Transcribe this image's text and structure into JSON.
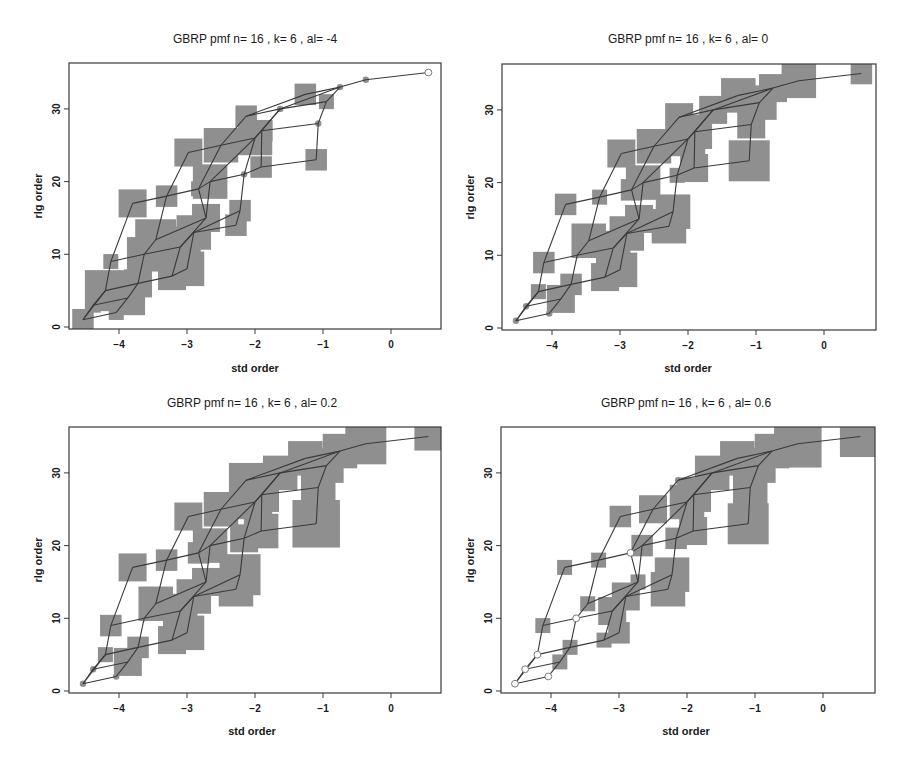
{
  "chart_data": [
    {
      "type": "scatter",
      "title": "GBRP pmf  n= 16 , k= 6 , al= -4",
      "xlabel": "std order",
      "ylabel": "rlg order",
      "xticks": [
        -4,
        -3,
        -2,
        -1,
        0
      ],
      "yticks": [
        0,
        10,
        20,
        30
      ],
      "xlim": [
        -4.75,
        0.73
      ],
      "ylim": [
        -0.3,
        35.7
      ],
      "sizes": [
        2,
        1,
        1,
        4,
        5,
        3,
        3,
        4,
        1,
        4,
        5,
        5,
        4,
        2,
        3,
        2,
        3,
        2,
        1,
        4,
        0,
        2,
        2,
        3,
        4,
        4,
        2,
        0,
        2,
        0,
        1,
        2,
        0,
        0,
        0
      ],
      "open": [
        35
      ]
    },
    {
      "type": "scatter",
      "title": "GBRP pmf  n= 16 , k= 6 , al= 0",
      "xlabel": "std order",
      "ylabel": "rlg order",
      "xticks": [
        -4,
        -3,
        -2,
        -1,
        0
      ],
      "yticks": [
        0,
        10,
        20,
        30
      ],
      "xlim": [
        -4.75,
        0.73
      ],
      "ylim": [
        -0.3,
        35.7
      ],
      "sizes": [
        0,
        0,
        0,
        3,
        1,
        2,
        3,
        4,
        2,
        0,
        4,
        4,
        4,
        4,
        3,
        4,
        2,
        1,
        2,
        4,
        1,
        3,
        5,
        3,
        4,
        4,
        4,
        3,
        3,
        3,
        4,
        4,
        3,
        4,
        2
      ],
      "open": []
    },
    {
      "type": "scatter",
      "title": "GBRP pmf  n= 16 , k= 6 , al= 0.2",
      "xlabel": "std order",
      "ylabel": "rlg order",
      "xticks": [
        -4,
        -3,
        -2,
        -1,
        0
      ],
      "yticks": [
        0,
        10,
        20,
        30
      ],
      "xlim": [
        -4.75,
        0.73
      ],
      "ylim": [
        -0.3,
        35.7
      ],
      "sizes": [
        0,
        0,
        0,
        3,
        1,
        2,
        3,
        4,
        2,
        0,
        4,
        4,
        4,
        4,
        3,
        5,
        3,
        2,
        2,
        4,
        3,
        4,
        6,
        3,
        4,
        4,
        4,
        4,
        4,
        4,
        4,
        4,
        4,
        5,
        3
      ],
      "open": []
    },
    {
      "type": "scatter",
      "title": "GBRP pmf  n= 16 , k= 6 , al= 0.6",
      "xlabel": "std order",
      "ylabel": "rlg order",
      "xticks": [
        -4,
        -3,
        -2,
        -1,
        0
      ],
      "yticks": [
        0,
        10,
        20,
        30
      ],
      "xlim": [
        -4.75,
        0.73
      ],
      "ylim": [
        -0.3,
        35.7
      ],
      "sizes": [
        0,
        0,
        0,
        1,
        0,
        1,
        1,
        2,
        1,
        0,
        3,
        1,
        3,
        4,
        1,
        4,
        1,
        1,
        0,
        2,
        2,
        3,
        5,
        2,
        3,
        4,
        4,
        4,
        0,
        4,
        4,
        4,
        4,
        6,
        5
      ],
      "open": [
        1,
        2,
        3,
        5,
        10,
        19
      ]
    }
  ],
  "lattice": {
    "x": [
      -4.53,
      -4.04,
      -4.38,
      -3.87,
      -4.2,
      -3.72,
      -3.22,
      -3.0,
      -4.12,
      -3.63,
      -3.1,
      -3.46,
      -2.9,
      -2.28,
      -2.72,
      -2.22,
      -3.8,
      -3.3,
      -2.83,
      -2.66,
      -2.16,
      -1.91,
      -1.1,
      -2.98,
      -2.5,
      -2.0,
      -1.9,
      -1.07,
      -2.13,
      -1.63,
      -0.95,
      -1.26,
      -0.75,
      -0.37,
      0.55
    ],
    "y": [
      1,
      2,
      3,
      4,
      5,
      6,
      7,
      8,
      9,
      10,
      11,
      12,
      13,
      14,
      15,
      16,
      17,
      18,
      19,
      20,
      21,
      22,
      23,
      24,
      25,
      26,
      27,
      28,
      29,
      30,
      31,
      32,
      33,
      34,
      35
    ],
    "edges": [
      [
        1,
        2
      ],
      [
        1,
        3
      ],
      [
        1,
        5
      ],
      [
        2,
        4
      ],
      [
        3,
        4
      ],
      [
        3,
        5
      ],
      [
        4,
        6
      ],
      [
        5,
        6
      ],
      [
        5,
        9
      ],
      [
        6,
        7
      ],
      [
        6,
        10
      ],
      [
        7,
        8
      ],
      [
        7,
        11
      ],
      [
        8,
        13
      ],
      [
        9,
        10
      ],
      [
        9,
        17
      ],
      [
        10,
        12
      ],
      [
        10,
        11
      ],
      [
        11,
        13
      ],
      [
        11,
        15
      ],
      [
        12,
        18
      ],
      [
        12,
        15
      ],
      [
        13,
        14
      ],
      [
        13,
        16
      ],
      [
        14,
        16
      ],
      [
        15,
        19
      ],
      [
        15,
        20
      ],
      [
        16,
        21
      ],
      [
        17,
        18
      ],
      [
        18,
        19
      ],
      [
        18,
        24
      ],
      [
        19,
        20
      ],
      [
        19,
        25
      ],
      [
        20,
        21
      ],
      [
        20,
        26
      ],
      [
        21,
        22
      ],
      [
        21,
        26
      ],
      [
        22,
        23
      ],
      [
        22,
        27
      ],
      [
        23,
        28
      ],
      [
        24,
        25
      ],
      [
        25,
        26
      ],
      [
        25,
        29
      ],
      [
        26,
        27
      ],
      [
        26,
        30
      ],
      [
        27,
        28
      ],
      [
        27,
        30
      ],
      [
        28,
        31
      ],
      [
        29,
        30
      ],
      [
        29,
        32
      ],
      [
        30,
        31
      ],
      [
        30,
        33
      ],
      [
        31,
        33
      ],
      [
        32,
        33
      ],
      [
        33,
        34
      ],
      [
        34,
        35
      ]
    ]
  },
  "panels": [
    {
      "title": "GBRP pmf  n= 16 , k= 6 , al= -4",
      "xlabel": "std order",
      "ylabel": "rlg order"
    },
    {
      "title": "GBRP pmf  n= 16 , k= 6 , al= 0",
      "xlabel": "std order",
      "ylabel": "rlg order"
    },
    {
      "title": "GBRP pmf  n= 16 , k= 6 , al= 0.2",
      "xlabel": "std order",
      "ylabel": "rlg order"
    },
    {
      "title": "GBRP pmf  n= 16 , k= 6 , al= 0.6",
      "xlabel": "std order",
      "ylabel": "rlg order"
    }
  ],
  "colors": {
    "marker_fill": "#8f8f8f",
    "line": "#3a3a3a",
    "frame": "#3a3a3a",
    "open_marker": "#7a7a7a"
  }
}
